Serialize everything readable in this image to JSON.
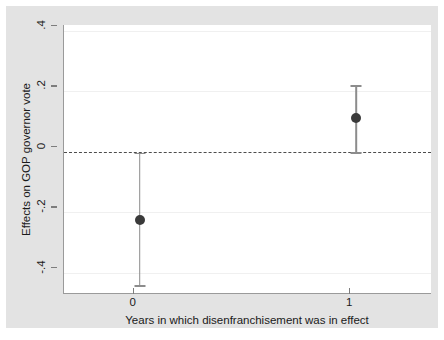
{
  "chart_data": {
    "type": "scatter",
    "title": "",
    "subtitle": "",
    "xlabel": "Years in which disenfranchisement was in effect",
    "ylabel": "Effects on GOP governor vote",
    "x": [
      0,
      1
    ],
    "xticklabels": [
      "0",
      "1"
    ],
    "xlim": [
      -0.35,
      1.35
    ],
    "yticklabels": [
      ".4",
      ".2",
      "0",
      "-.2",
      "-.4"
    ],
    "ytickvalues": [
      0.4,
      0.2,
      0,
      -0.2,
      -0.4
    ],
    "ylim": [
      -0.47,
      0.42
    ],
    "grid": true,
    "legend": "none",
    "reference_line": {
      "value": 0,
      "style": "dashed",
      "color": "#4d4d4d"
    },
    "series": [
      {
        "name": "Effect estimate with 95% confidence interval",
        "marker": "filled-circle",
        "marker_color": "#3a3a3a",
        "errorbar_color": "#8c8c8c",
        "points": [
          {
            "x": 0,
            "xlabel": "0",
            "value": -0.226,
            "ci_low": -0.44,
            "ci_high": -0.002
          },
          {
            "x": 1,
            "xlabel": "1",
            "value": 0.112,
            "ci_low": 0.0,
            "ci_high": 0.22
          }
        ]
      }
    ]
  },
  "figure": {
    "plot_background": "#ffffff",
    "outer_background": "#e3e3e3",
    "axis_color": "#9a9a9a"
  }
}
